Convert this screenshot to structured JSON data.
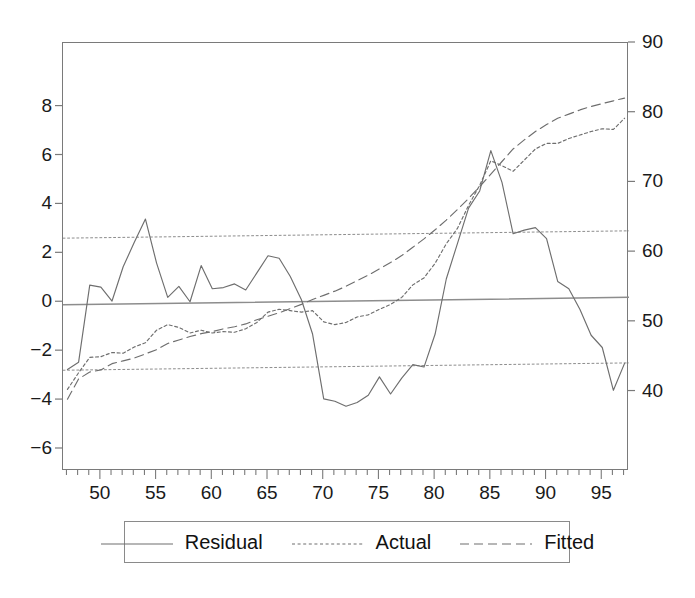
{
  "chart_data": {
    "type": "line",
    "title": "",
    "subtitle": "",
    "xlabel": "",
    "ylabel": "",
    "grid": false,
    "legend_position": "bottom",
    "x": [
      47,
      48,
      49,
      50,
      51,
      52,
      53,
      54,
      55,
      56,
      57,
      58,
      59,
      60,
      61,
      62,
      63,
      64,
      65,
      66,
      67,
      68,
      69,
      70,
      71,
      72,
      73,
      74,
      75,
      76,
      77,
      78,
      79,
      80,
      81,
      82,
      83,
      84,
      85,
      86,
      87,
      88,
      89,
      90,
      91,
      92,
      93,
      94,
      95,
      96,
      97
    ],
    "xtick_labels": [
      "50",
      "55",
      "60",
      "65",
      "70",
      "75",
      "80",
      "85",
      "90",
      "95"
    ],
    "xtick_values": [
      50,
      55,
      60,
      65,
      70,
      75,
      80,
      85,
      90,
      95
    ],
    "xlim": [
      46.6,
      97.4
    ],
    "left_axis": {
      "name": "Residual",
      "ylim": [
        -6.9,
        10.6
      ],
      "ticks": [
        -6,
        -4,
        -2,
        0,
        2,
        4,
        6,
        8
      ],
      "tick_labels": [
        "−6",
        "−4",
        "−2",
        "0",
        "2",
        "4",
        "6",
        "8"
      ]
    },
    "right_axis": {
      "name": "Actual / Fitted",
      "ylim": [
        28.6,
        90.0
      ],
      "ticks": [
        40,
        50,
        60,
        70,
        80,
        90
      ],
      "tick_labels": [
        "40",
        "50",
        "60",
        "70",
        "80",
        "90"
      ]
    },
    "series": [
      {
        "name": "Residual",
        "axis": "left",
        "style": "solid",
        "color": "#6e6e6e",
        "values": [
          -2.75,
          -2.45,
          0.7,
          0.62,
          0.05,
          1.45,
          2.45,
          3.4,
          1.6,
          0.2,
          0.65,
          0.02,
          1.5,
          0.55,
          0.6,
          0.75,
          0.5,
          1.2,
          1.9,
          1.8,
          1.05,
          0.1,
          -1.3,
          -3.95,
          -4.05,
          -4.25,
          -4.1,
          -3.8,
          -3.05,
          -3.75,
          -3.1,
          -2.55,
          -2.65,
          -1.3,
          0.95,
          2.4,
          3.85,
          4.55,
          6.2,
          4.9,
          2.8,
          2.95,
          3.05,
          2.6,
          0.85,
          0.55,
          -0.3,
          -1.35,
          -1.85,
          -3.6,
          -2.5
        ]
      },
      {
        "name": "Actual",
        "axis": "right",
        "style": "dotted",
        "color": "#6e6e6e",
        "values": [
          40.3,
          42.7,
          44.9,
          45.0,
          45.6,
          45.5,
          46.4,
          47.0,
          48.8,
          49.6,
          49.2,
          48.4,
          48.8,
          48.4,
          48.6,
          48.5,
          49.0,
          49.9,
          51.4,
          51.8,
          51.6,
          51.4,
          51.6,
          50.0,
          49.6,
          49.9,
          50.7,
          51.0,
          51.8,
          52.5,
          53.5,
          55.3,
          56.3,
          58.4,
          61.2,
          63.4,
          66.7,
          69.6,
          73.1,
          72.4,
          71.6,
          73.2,
          74.8,
          75.6,
          75.6,
          76.3,
          76.8,
          77.3,
          77.7,
          77.6,
          79.2
        ]
      },
      {
        "name": "Fitted",
        "axis": "right",
        "style": "dashed",
        "color": "#6e6e6e",
        "values": [
          38.9,
          41.8,
          42.8,
          43.1,
          44.0,
          44.4,
          44.8,
          45.4,
          46.0,
          46.9,
          47.4,
          47.9,
          48.3,
          48.6,
          49.0,
          49.3,
          49.7,
          50.3,
          50.8,
          51.3,
          51.9,
          52.5,
          53.2,
          53.8,
          54.4,
          55.1,
          55.9,
          56.7,
          57.6,
          58.5,
          59.5,
          60.7,
          61.9,
          63.2,
          64.6,
          66.1,
          67.7,
          69.4,
          71.2,
          73.0,
          74.8,
          76.1,
          77.3,
          78.3,
          79.2,
          79.8,
          80.4,
          80.9,
          81.3,
          81.7,
          82.1
        ]
      }
    ],
    "bands": [
      {
        "name": "upper-2-sigma",
        "axis": "left",
        "style": "fine-dotted",
        "start": 2.62,
        "end": 2.92
      },
      {
        "name": "lower-2-sigma",
        "axis": "left",
        "style": "fine-dotted",
        "start": -2.78,
        "end": -2.48
      }
    ],
    "zero_line": {
      "name": "zero-reference",
      "axis": "left",
      "start": -0.1,
      "end": 0.2
    }
  },
  "legend": {
    "items": [
      {
        "label": "Residual",
        "style": "solid"
      },
      {
        "label": "Actual",
        "style": "dotted"
      },
      {
        "label": "Fitted",
        "style": "dashed"
      }
    ]
  }
}
